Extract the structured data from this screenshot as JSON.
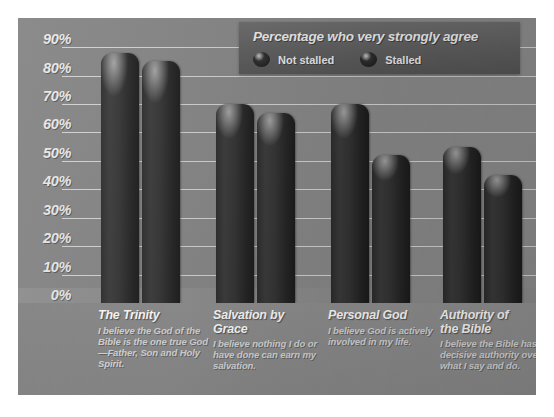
{
  "chart_data": {
    "type": "bar",
    "title": "Percentage who very strongly agree",
    "xlabel": "",
    "ylabel": "",
    "ylim": [
      0,
      95
    ],
    "grid": true,
    "legend_position": "top-right",
    "categories": [
      "The Trinity",
      "Salvation by Grace",
      "Personal God",
      "Authority of the Bible"
    ],
    "category_titles": [
      "The Trinity",
      "Salvation by\nGrace",
      "Personal God",
      "Authority of\nthe Bible"
    ],
    "category_descriptions": [
      "I believe the God of the Bible is the one true God—Father, Son and Holy Spirit.",
      "I believe nothing I do or have done can earn my salvation.",
      "I believe God is actively involved in my life.",
      "I believe the Bible has decisive authority over what I say and do."
    ],
    "yticks": [
      "0%",
      "10%",
      "20%",
      "30%",
      "40%",
      "50%",
      "60%",
      "70%",
      "80%",
      "90%"
    ],
    "ytick_values": [
      0,
      10,
      20,
      30,
      40,
      50,
      60,
      70,
      80,
      90
    ],
    "series": [
      {
        "name": "Not stalled",
        "values": [
          88,
          70,
          70,
          55
        ]
      },
      {
        "name": "Stalled",
        "values": [
          85,
          67,
          52,
          45
        ]
      }
    ],
    "colors": {
      "bar_dark": "#2c2c2c",
      "bar_shadow": "#1b1b1b",
      "panel_background": "#8e8e8e",
      "plot_background": "#8b8b8b",
      "legend_background": "#5f5f5f",
      "gridline": "#e2e2e2",
      "tick_label": "#e9e9e9",
      "category_title": "#ffffff",
      "category_desc": "#d8d8d8"
    }
  },
  "legend": {
    "title": "Percentage who very strongly agree",
    "items": [
      {
        "label": "Not stalled"
      },
      {
        "label": "Stalled"
      }
    ]
  }
}
